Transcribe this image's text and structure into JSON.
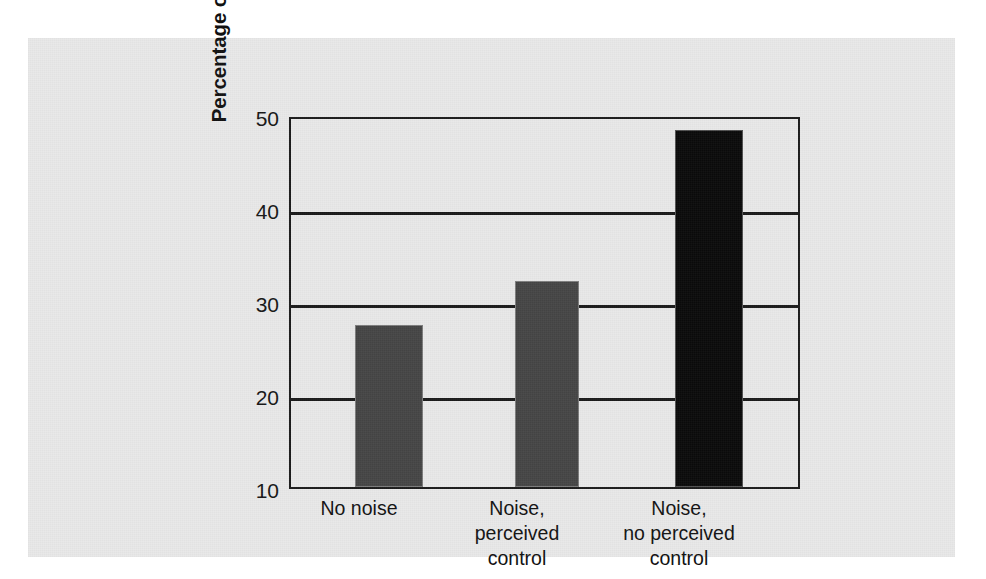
{
  "chart_data": {
    "type": "bar",
    "title": "",
    "xlabel": "",
    "ylabel": "Percentage of errors in problem solving",
    "categories": [
      "No noise",
      "Noise,\nperceived\ncontrol",
      "Noise,\nno perceived\ncontrol"
    ],
    "values": [
      27.4,
      32.1,
      48.4
    ],
    "ylim": [
      10,
      50
    ],
    "yticks": [
      10,
      20,
      30,
      40,
      50
    ],
    "ytick_labels": [
      "10",
      "20",
      "30",
      "40",
      "50"
    ],
    "grid": true,
    "legend": "none",
    "bar_colors": [
      "#454545",
      "#454545",
      "#0a0a0a"
    ],
    "axis_color": "#1b1b1b",
    "panel_color": "#e9e9e9",
    "page_color": "#ffffff"
  },
  "figure": {
    "panel_background": "#e9e9e9",
    "frame_color": "#1b1b1b"
  }
}
